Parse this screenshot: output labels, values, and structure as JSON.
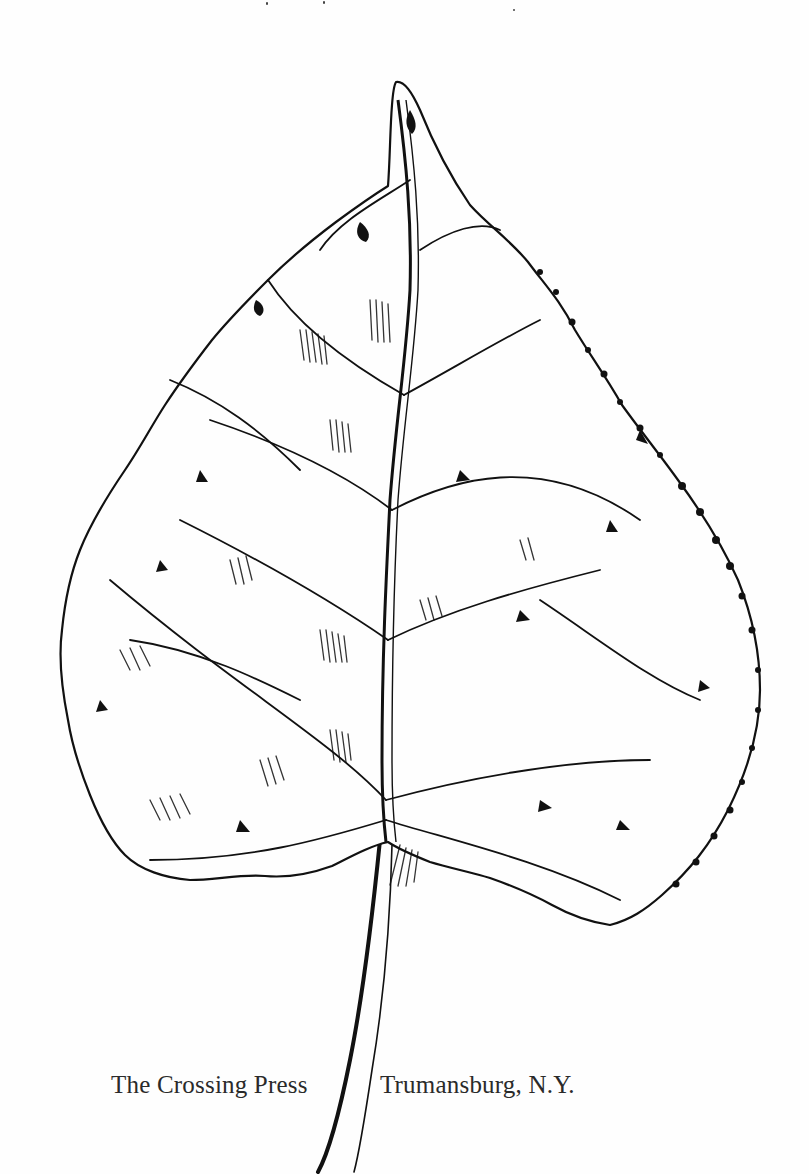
{
  "page": {
    "type": "title-page",
    "illustration": {
      "subject": "leaf-drawing",
      "style": "pen-and-ink",
      "stroke_color": "#111111",
      "background_color": "#fefefe"
    },
    "imprint": {
      "publisher": "The Crossing Press",
      "location": "Trumansburg, N.Y."
    }
  }
}
